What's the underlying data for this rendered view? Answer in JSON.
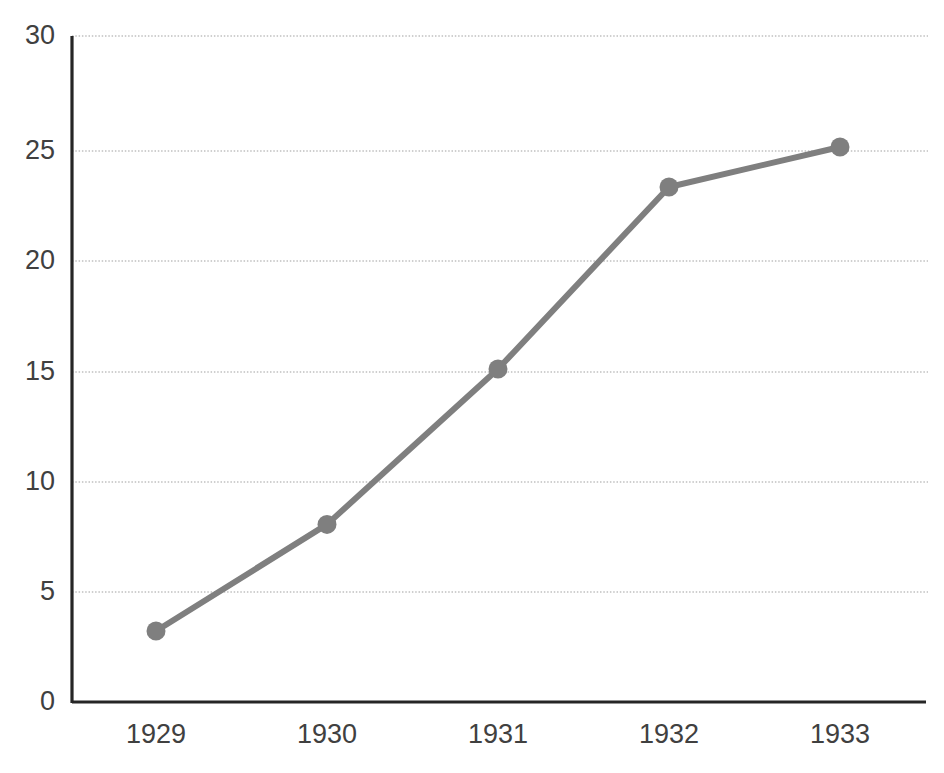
{
  "chart_data": {
    "type": "line",
    "title": "",
    "subtitle": "",
    "xlabel": "",
    "ylabel": "",
    "categories": [
      "1929",
      "1930",
      "1931",
      "1932",
      "1933"
    ],
    "x": [
      1929,
      1930,
      1931,
      1932,
      1933
    ],
    "values": [
      3.2,
      8,
      15,
      23.2,
      25
    ],
    "series": [
      {
        "name": "",
        "values": [
          3.2,
          8,
          15,
          23.2,
          25
        ],
        "color": "#7f7f7f",
        "marker": "circle",
        "line_width": 6
      }
    ],
    "ylim": [
      0,
      30
    ],
    "ytick_labels": [
      "0",
      "5",
      "10",
      "15",
      "20",
      "25",
      "30"
    ],
    "yticks": [
      0,
      5,
      10,
      15,
      20,
      25,
      30
    ],
    "xtick_labels": [
      "1929",
      "1930",
      "1931",
      "1932",
      "1933"
    ],
    "grid": "horizontal-dotted",
    "grid_color": "#c8c8c8",
    "axis_color": "#262626",
    "legend": "none",
    "legend_position": "none",
    "background": "#ffffff",
    "annotations": []
  },
  "axes": {
    "y_labels": [
      "30",
      "25",
      "20",
      "15",
      "10",
      "5",
      "0"
    ],
    "x_labels": [
      "1929",
      "1930",
      "1931",
      "1932",
      "1933"
    ]
  },
  "points": [
    {
      "label": "1929",
      "value": "3.2"
    },
    {
      "label": "1930",
      "value": "8"
    },
    {
      "label": "1931",
      "value": "15"
    },
    {
      "label": "1932",
      "value": "23.2"
    },
    {
      "label": "1933",
      "value": "25"
    }
  ]
}
